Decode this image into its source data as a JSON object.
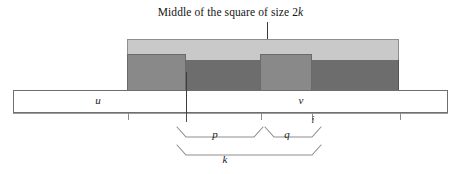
{
  "figure": {
    "caption_prefix": "Middle of the square of size 2",
    "caption_variable": "k",
    "caption_full": "Middle of the square of size 2k"
  },
  "bar": {
    "left_segment_label": "u",
    "right_segment_label": "v"
  },
  "axis": {
    "index_label": "i"
  },
  "braces": {
    "p_label": "p",
    "q_label": "q",
    "k_label": "k"
  },
  "colors": {
    "light_gray": "#c9c9c9",
    "medium_gray": "#898989",
    "dark_gray": "#6d6d6d",
    "outline": "#6f6f6f",
    "text": "#1a1a1a",
    "background": "#ffffff"
  }
}
